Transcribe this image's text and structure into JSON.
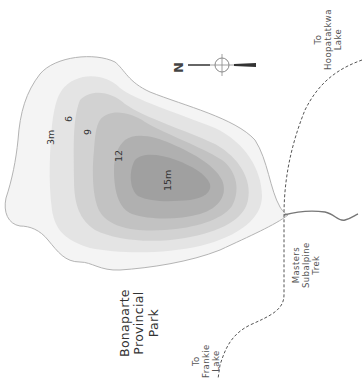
{
  "map": {
    "title": "Lake depth contour map",
    "colors": {
      "shoreline": "#b4b4b4",
      "depth_0_3": "#f4f4f4",
      "depth_3_6": "#e4e4e4",
      "depth_6_9": "#d2d2d2",
      "depth_9_12": "#c2c2c2",
      "depth_12_15": "#b0b0b0",
      "depth_15": "#a0a0a0",
      "trail": "#555555",
      "stream": "#777777"
    },
    "depth_labels": {
      "d3": "3m",
      "d6": "6",
      "d9": "9",
      "d12": "12",
      "d15": "15m"
    },
    "compass": {
      "north_label": "N"
    },
    "place_labels": {
      "park": "Bonaparte\nProvincial\nPark",
      "hoopatatkwa": "To\nHoopatatkwa\nLake",
      "trek": "Masters\nSubalpine\nTrek",
      "frankie": "To\nFrankie\nLake"
    }
  }
}
